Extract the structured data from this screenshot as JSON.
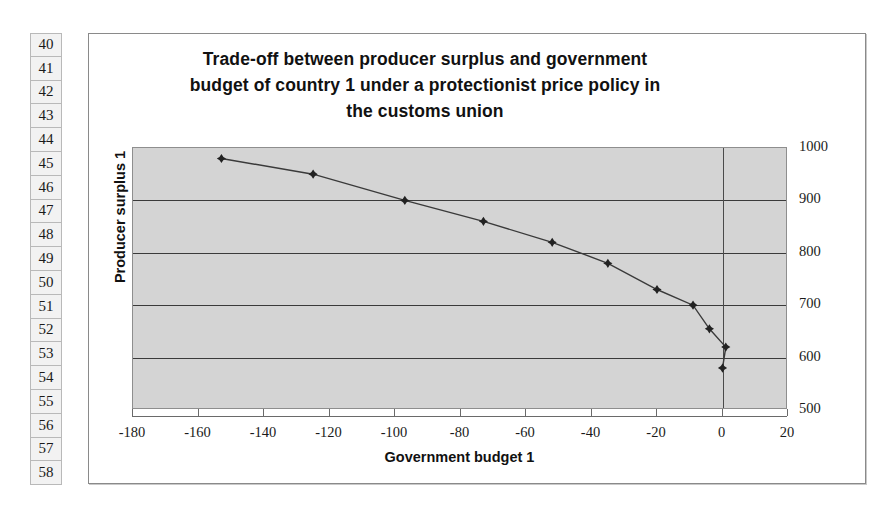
{
  "spreadsheet": {
    "row_headers": [
      "40",
      "41",
      "42",
      "43",
      "44",
      "45",
      "46",
      "47",
      "48",
      "49",
      "50",
      "51",
      "52",
      "53",
      "54",
      "55",
      "56",
      "57",
      "58"
    ]
  },
  "chart_data": {
    "type": "line",
    "title": "Trade-off between producer surplus and government budget of country 1 under a protectionist price policy in the customs union",
    "title_lines": [
      "Trade-off between producer surplus and government",
      "budget of country 1 under a protectionist price policy in",
      "the customs union"
    ],
    "xlabel": "Government budget 1",
    "ylabel": "Producer surplus 1",
    "xlim": [
      -180,
      20
    ],
    "ylim": [
      500,
      1000
    ],
    "xticks": [
      "-180",
      "-160",
      "-140",
      "-120",
      "-100",
      "-80",
      "-60",
      "-40",
      "-20",
      "0",
      "20"
    ],
    "xtick_values": [
      -180,
      -160,
      -140,
      -120,
      -100,
      -80,
      -60,
      -40,
      -20,
      0,
      20
    ],
    "yticks": [
      "1000",
      "900",
      "800",
      "700",
      "600",
      "500"
    ],
    "ytick_values": [
      1000,
      900,
      800,
      700,
      600,
      500
    ],
    "ytick_position": "right",
    "grid": "horizontal",
    "legend": "none",
    "marker": "diamond",
    "plot_background": "#d4d4d4",
    "series": [
      {
        "name": "Producer surplus 1",
        "x": [
          -153,
          -125,
          -97,
          -73,
          -52,
          -35,
          -20,
          -9,
          -4,
          1,
          0
        ],
        "y": [
          980,
          950,
          900,
          860,
          820,
          780,
          730,
          700,
          655,
          620,
          580
        ]
      }
    ]
  },
  "colors": {
    "plot_bg": "#d4d4d4",
    "gridline": "#3a3a3a",
    "series_line": "#3a3a3a",
    "frame_border": "#8a8a8a",
    "text": "#111111"
  }
}
